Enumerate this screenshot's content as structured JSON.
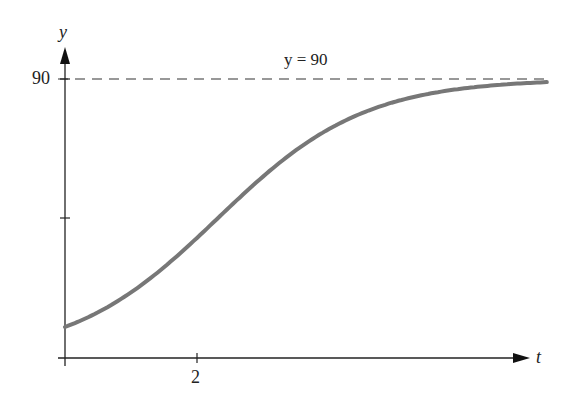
{
  "chart_data": {
    "type": "line",
    "title": "",
    "xlabel": "t",
    "ylabel": "y",
    "asymptote_label": "y = 90",
    "y_tick_labels": [
      "90"
    ],
    "x_tick_labels": [
      "2"
    ],
    "asymptote": 90,
    "model": "logistic y = 90/(1+8e^{-0.9t})",
    "x": [
      0,
      0.5,
      1,
      1.5,
      2,
      2.5,
      3,
      3.5,
      4,
      5,
      6,
      7
    ],
    "values": [
      10.0,
      15.0,
      21.8,
      30.2,
      39.7,
      49.7,
      58.9,
      67.0,
      73.4,
      81.9,
      86.4,
      88.5
    ],
    "xlim": [
      0,
      7
    ],
    "ylim": [
      0,
      90
    ],
    "grid": false,
    "curve_color": "#777777"
  }
}
